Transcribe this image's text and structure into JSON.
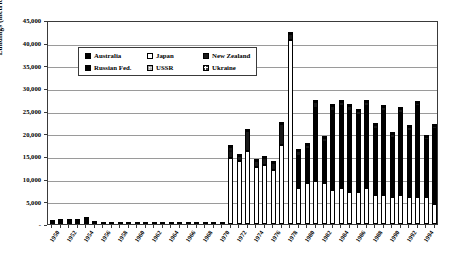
{
  "chart_data": {
    "type": "bar",
    "title": "",
    "subtitle": "",
    "xlabel": "",
    "ylabel": "Landings (metric tons)",
    "ylim": [
      0,
      45000
    ],
    "ytick_labels": [
      "-",
      "5,000",
      "10,000",
      "15,000",
      "20,000",
      "25,000",
      "30,000",
      "35,000",
      "40,000",
      "45,000"
    ],
    "ytick_values": [
      0,
      5000,
      10000,
      15000,
      20000,
      25000,
      30000,
      35000,
      40000,
      45000
    ],
    "grid": true,
    "stacked": true,
    "legend_position": "inside-top-left",
    "categories": [
      1950,
      1951,
      1952,
      1953,
      1954,
      1955,
      1956,
      1957,
      1958,
      1959,
      1960,
      1961,
      1962,
      1963,
      1964,
      1965,
      1966,
      1967,
      1968,
      1969,
      1970,
      1971,
      1972,
      1973,
      1974,
      1975,
      1976,
      1977,
      1978,
      1979,
      1980,
      1981,
      1982,
      1983,
      1984,
      1985,
      1986,
      1987,
      1988,
      1989,
      1990,
      1991,
      1992,
      1993,
      1994,
      1995
    ],
    "xtick_labels": [
      "1950",
      "1952",
      "1954",
      "1956",
      "1958",
      "1960",
      "1962",
      "1964",
      "1966",
      "1968",
      "1970",
      "1972",
      "1974",
      "1976",
      "1978",
      "1980",
      "1982",
      "1984",
      "1986",
      "1988",
      "1990",
      "1992",
      "1994"
    ],
    "series": [
      {
        "name": "Australia",
        "color": "#000000",
        "pattern": "solid-black",
        "values": [
          900,
          1100,
          1150,
          1000,
          1500,
          700,
          500,
          450,
          400,
          400,
          350,
          300,
          450,
          400,
          300,
          250,
          200,
          150,
          120,
          100,
          80,
          60,
          50,
          50,
          60,
          60,
          60,
          60,
          60,
          60,
          60,
          60,
          60,
          60,
          60,
          60,
          60,
          60,
          60,
          60,
          60,
          60,
          60,
          60,
          60,
          60
        ]
      },
      {
        "name": "Japan",
        "color": "#ffffff",
        "pattern": "white-outline",
        "values": [
          0,
          0,
          0,
          0,
          0,
          0,
          0,
          0,
          0,
          0,
          0,
          0,
          0,
          0,
          0,
          0,
          0,
          0,
          0,
          0,
          0,
          14500,
          14000,
          16000,
          12500,
          13000,
          12000,
          17500,
          40500,
          8000,
          9000,
          9500,
          9000,
          7500,
          8000,
          7000,
          7000,
          8000,
          6500,
          6500,
          6000,
          6500,
          6000,
          6000,
          6000,
          4500
        ]
      },
      {
        "name": "New Zealand",
        "color": "#1a1a1a",
        "pattern": "solid-dark",
        "values": [
          0,
          0,
          0,
          0,
          0,
          0,
          0,
          0,
          0,
          0,
          0,
          0,
          0,
          0,
          0,
          0,
          0,
          0,
          0,
          0,
          0,
          2500,
          1000,
          4500,
          1500,
          1500,
          1500,
          4500,
          1500,
          1000,
          1000,
          1500,
          1000,
          1000,
          1000,
          1000,
          1000,
          1000,
          800,
          800,
          800,
          800,
          800,
          800,
          800,
          600
        ]
      },
      {
        "name": "Russian Fed.",
        "color": "#000000",
        "pattern": "solid-black",
        "values": [
          0,
          0,
          0,
          0,
          0,
          0,
          0,
          0,
          0,
          0,
          0,
          0,
          0,
          0,
          0,
          0,
          0,
          0,
          0,
          0,
          0,
          0,
          0,
          0,
          0,
          0,
          0,
          0,
          0,
          7000,
          7500,
          16000,
          9000,
          17500,
          18000,
          18000,
          17000,
          18000,
          14500,
          18500,
          13000,
          18000,
          14500,
          20000,
          12500,
          16500
        ]
      },
      {
        "name": "USSR",
        "color": "#eeeeee",
        "pattern": "light-grid",
        "values": [
          0,
          0,
          0,
          0,
          0,
          0,
          0,
          0,
          0,
          0,
          0,
          0,
          0,
          0,
          0,
          0,
          0,
          0,
          0,
          0,
          0,
          0,
          0,
          0,
          0,
          0,
          0,
          0,
          0,
          0,
          0,
          0,
          0,
          0,
          0,
          0,
          0,
          0,
          0,
          0,
          0,
          0,
          0,
          0,
          0,
          0
        ]
      },
      {
        "name": "Ukraine",
        "color": "#ffffff",
        "pattern": "crosshatch",
        "values": [
          0,
          0,
          0,
          0,
          0,
          0,
          0,
          0,
          0,
          0,
          0,
          0,
          0,
          0,
          0,
          0,
          0,
          0,
          0,
          0,
          0,
          0,
          0,
          0,
          0,
          0,
          0,
          0,
          0,
          0,
          0,
          0,
          0,
          0,
          0,
          0,
          0,
          0,
          0,
          0,
          0,
          0,
          0,
          0,
          0,
          0
        ]
      }
    ],
    "annotations": [
      {
        "label": "*",
        "x_index": 21,
        "y_value": 16000
      }
    ]
  },
  "legend": {
    "entries": [
      {
        "label": "Australia",
        "swatch": "sw-australia"
      },
      {
        "label": "Japan",
        "swatch": "sw-japan"
      },
      {
        "label": "New Zealand",
        "swatch": "sw-newzealand"
      },
      {
        "label": "Russian Fed.",
        "swatch": "sw-russian"
      },
      {
        "label": "USSR",
        "swatch": "sw-ussr"
      },
      {
        "label": "Ukraine",
        "swatch": "sw-ukraine"
      }
    ]
  }
}
